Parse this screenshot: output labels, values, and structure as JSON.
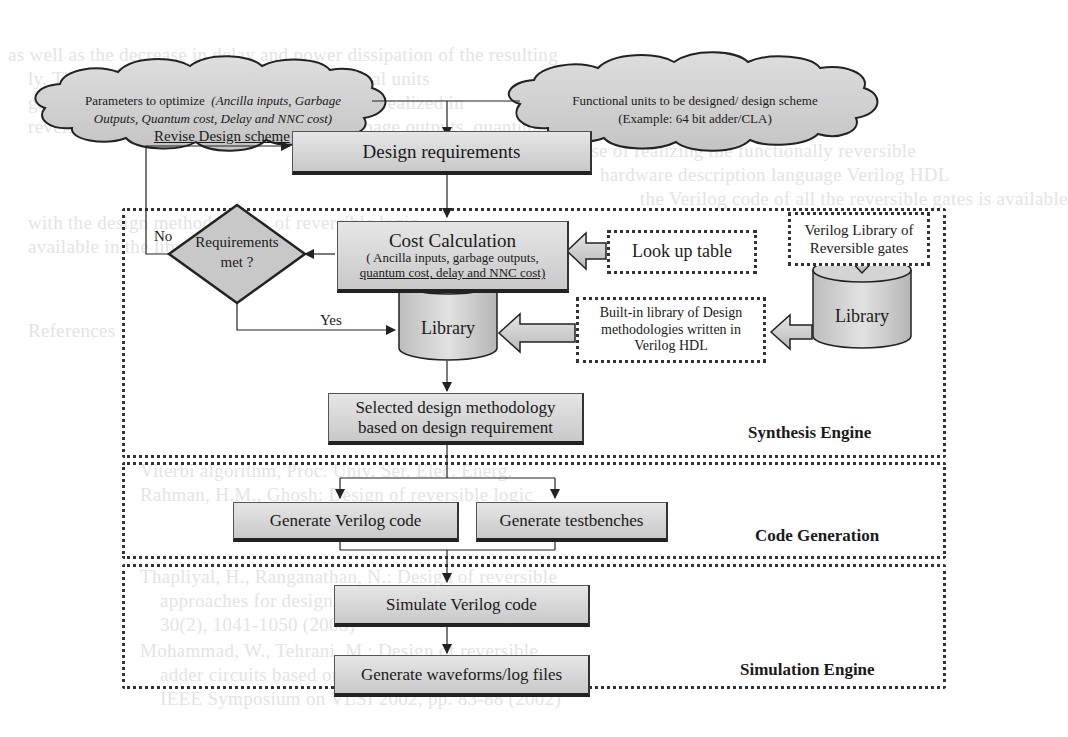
{
  "clouds": {
    "parameters": {
      "prefix": "Parameters to optimize",
      "italic_line1": "(Ancilla inputs, Garbage",
      "italic_line2": "Outputs,  Quantum cost, Delay and NNC cost)"
    },
    "functional_units": {
      "line1": "Functional units to be designed/ design scheme",
      "line2": "(Example:  64 bit adder/CLA)"
    }
  },
  "nodes": {
    "design_requirements": "Design requirements",
    "cost_calculation": {
      "title": "Cost Calculation",
      "detail_line1": "( Ancilla inputs, garbage  outputs,",
      "detail_line2": "quantum cost, delay and NNC cost)"
    },
    "requirements_met": {
      "line1": "Requirements",
      "line2": "met ?"
    },
    "look_up_table": "Look up table",
    "verilog_gate_library": {
      "line1": "Verilog Library of",
      "line2": "Reversible gates"
    },
    "library_main": "Library",
    "library_gates": "Library",
    "builtin_library": {
      "line1": "Built-in library of  Design",
      "line2": "methodologies  written in",
      "line3": "Verilog HDL"
    },
    "selected_methodology": {
      "line1": "Selected design methodology",
      "line2": "based on design requirement"
    },
    "generate_verilog": "Generate  Verilog  code",
    "generate_testbenches": "Generate testbenches",
    "simulate_verilog": "Simulate  Verilog  code",
    "generate_waveforms": "Generate waveforms/log files"
  },
  "edge_labels": {
    "revise": "Revise Design scheme",
    "no": "No",
    "yes": "Yes"
  },
  "sections": {
    "synthesis": "Synthesis Engine",
    "code_generation": "Code Generation",
    "simulation": "Simulation Engine"
  },
  "background_text": [
    "as well as the decrease in delay and power dissipation of the resulting",
    "ly. They are designed such that the functional units",
    "gates. A particular design or function can be realized in",
    "reversing the number of ancilla inputs, garbage outputs, quantum cost",
    "and the delay. For the purpose of realizing the functionally reversible",
    "hardware description language Verilog HDL",
    "the Verilog code of all the reversible gates is available",
    "with the design methodologies of reversible logic",
    "available in the library",
    "References",
    "Viterbi algorithm, Proc. Univ. Ser. Elec. Energ.",
    "Rahman, H.M., Ghosh: Design of reversible logic",
    "Thapliyal, H., Ranganathan, N.: Design of reversible",
    "approaches for designing reversible circuits",
    "30(2), 1041-1050 (2008)",
    "Mohammad, W., Tehrani, M.: Design of reversible",
    "adder circuits based on a novel reversible gate",
    "IEEE Symposium on VLSI 2002, pp. 83-88 (2002)"
  ]
}
